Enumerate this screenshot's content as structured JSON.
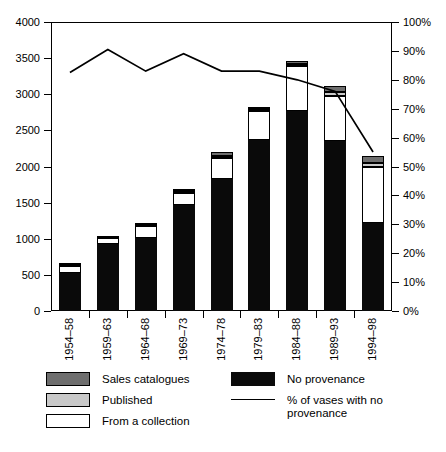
{
  "chart_data": {
    "type": "bar",
    "subtype": "stacked-bar-with-line",
    "title": "",
    "xlabel": "",
    "ylabel": "",
    "ylim": [
      0,
      4000
    ],
    "y2lim": [
      0,
      100
    ],
    "grid": false,
    "legend_position": "bottom",
    "categories": [
      "1954–58",
      "1959–63",
      "1964–68",
      "1969–73",
      "1974–78",
      "1979–83",
      "1984–88",
      "1989–93",
      "1994–98"
    ],
    "y_ticks": [
      0,
      500,
      1000,
      1500,
      2000,
      2500,
      3000,
      3500,
      4000
    ],
    "y_tick_labels": [
      "0",
      "500",
      "1000",
      "1500",
      "2000",
      "2500",
      "3000",
      "3500",
      "4000"
    ],
    "y2_ticks": [
      0,
      10,
      20,
      30,
      40,
      50,
      60,
      70,
      80,
      90,
      100
    ],
    "y2_tick_labels": [
      "0%",
      "10%",
      "20%",
      "30%",
      "40%",
      "50%",
      "60%",
      "70%",
      "80%",
      "90%",
      "100%"
    ],
    "series": [
      {
        "name": "No provenance",
        "key": "no_provenance",
        "fill": "black",
        "values": [
          520,
          930,
          1010,
          1470,
          1825,
          2365,
          2775,
          2360,
          1225
        ]
      },
      {
        "name": "From a collection",
        "key": "from_collection",
        "fill": "white",
        "values": [
          100,
          75,
          165,
          160,
          290,
          400,
          615,
          620,
          775
        ]
      },
      {
        "name": "Published",
        "key": "published",
        "fill": "light",
        "values": [
          10,
          10,
          15,
          25,
          30,
          35,
          35,
          45,
          45
        ]
      },
      {
        "name": "Sales catalogues",
        "key": "sales_catalogues",
        "fill": "dark",
        "values": [
          15,
          15,
          15,
          25,
          55,
          30,
          40,
          85,
          100
        ]
      }
    ],
    "totals": [
      645,
      1030,
      1205,
      1680,
      2200,
      2830,
      3465,
      3110,
      2145
    ],
    "line_series": {
      "name": "% of vases with no provenance",
      "values": [
        82.5,
        90.5,
        83.0,
        89.0,
        83.0,
        83.0,
        80.0,
        76.0,
        55.0
      ]
    }
  },
  "legend": {
    "items": [
      {
        "label": "Sales catalogues",
        "swatch": "dark"
      },
      {
        "label": "Published",
        "swatch": "light"
      },
      {
        "label": "From a collection",
        "swatch": "white"
      },
      {
        "label": "No provenance",
        "swatch": "black"
      },
      {
        "label": "% of vases with no provenance",
        "swatch": "line"
      }
    ]
  },
  "colors": {
    "black": "#0a0a0a",
    "light_gray": "#c9c9c9",
    "dark_gray": "#6e6e6e",
    "white": "#ffffff",
    "axis": "#000000"
  }
}
